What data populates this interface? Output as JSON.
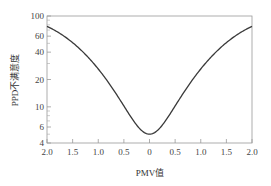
{
  "chart_data": {
    "type": "line",
    "title": "",
    "xlabel": "PMV值",
    "ylabel": "PPD不满意度",
    "yscale": "log",
    "ylim": [
      4,
      100
    ],
    "xlim": [
      -2.0,
      2.0
    ],
    "x_tick_labels": [
      "2.0",
      "1.5",
      "1.0",
      "0.5",
      "0",
      "0.5",
      "1.0",
      "1.5",
      "2.0"
    ],
    "x_tick_values": [
      -2.0,
      -1.5,
      -1.0,
      -0.5,
      0,
      0.5,
      1.0,
      1.5,
      2.0
    ],
    "y_tick_labels": [
      "100",
      "60",
      "40",
      "20",
      "10",
      "6",
      "4"
    ],
    "y_tick_values": [
      100,
      60,
      40,
      20,
      10,
      6,
      4
    ],
    "y_minor_ticks": [
      5,
      7,
      8,
      9,
      30,
      50,
      70,
      80,
      90
    ],
    "grid": false,
    "legend": null,
    "series": [
      {
        "name": "PPD",
        "formula": "PPD = 100 - 95*exp(-0.03353*PMV^4 - 0.2179*PMV^2)",
        "x": [
          -2.0,
          -1.5,
          -1.0,
          -0.5,
          0,
          0.5,
          1.0,
          1.5,
          2.0
        ],
        "values": [
          76.8,
          51.0,
          26.1,
          10.2,
          5.0,
          10.2,
          26.1,
          51.0,
          76.8
        ]
      }
    ]
  },
  "colors": {
    "curve": "#3a3a3a",
    "axis": "#888888",
    "text": "#444444"
  }
}
